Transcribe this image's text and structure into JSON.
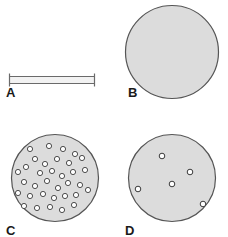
{
  "figure": {
    "type": "scientific-figure",
    "width": 228,
    "height": 237,
    "background_color": "#ffffff"
  },
  "style": {
    "disc_fill": "#dcdcdc",
    "disc_stroke": "#555555",
    "pore_fill": "#ffffff",
    "pore_stroke": "#3a3a3a",
    "bar_fill": "#f2f2f2",
    "bar_stroke": "#6a6a6a",
    "label_color": "#1a1a1a"
  },
  "panels": [
    {
      "id": "A",
      "label": "A",
      "name": "panel-a-side-view",
      "shape": "bar",
      "label_x": 6,
      "label_y": 92,
      "bar": {
        "x": 9,
        "y": 76,
        "width": 85,
        "height": 7,
        "end_cap_height": 13
      }
    },
    {
      "id": "B",
      "label": "B",
      "name": "panel-b-plain-disc",
      "shape": "circle",
      "label_x": 128,
      "label_y": 92,
      "circle": {
        "cx": 172,
        "cy": 52,
        "r": 47
      },
      "pores": []
    },
    {
      "id": "C",
      "label": "C",
      "name": "panel-c-dense-pores",
      "shape": "circle",
      "label_x": 6,
      "label_y": 228,
      "circle": {
        "cx": 55,
        "cy": 178,
        "r": 44
      },
      "pore_count": 34,
      "pore_radius": 2.6,
      "pores": [
        {
          "cx": 30,
          "cy": 149
        },
        {
          "cx": 49,
          "cy": 146
        },
        {
          "cx": 63,
          "cy": 149
        },
        {
          "cx": 75,
          "cy": 154
        },
        {
          "cx": 35,
          "cy": 159
        },
        {
          "cx": 45,
          "cy": 164
        },
        {
          "cx": 57,
          "cy": 159
        },
        {
          "cx": 69,
          "cy": 163
        },
        {
          "cx": 82,
          "cy": 158
        },
        {
          "cx": 18,
          "cy": 172
        },
        {
          "cx": 26,
          "cy": 167
        },
        {
          "cx": 40,
          "cy": 173
        },
        {
          "cx": 52,
          "cy": 171
        },
        {
          "cx": 62,
          "cy": 176
        },
        {
          "cx": 73,
          "cy": 172
        },
        {
          "cx": 85,
          "cy": 170
        },
        {
          "cx": 24,
          "cy": 182
        },
        {
          "cx": 35,
          "cy": 186
        },
        {
          "cx": 47,
          "cy": 181
        },
        {
          "cx": 58,
          "cy": 188
        },
        {
          "cx": 68,
          "cy": 183
        },
        {
          "cx": 80,
          "cy": 185
        },
        {
          "cx": 18,
          "cy": 193
        },
        {
          "cx": 30,
          "cy": 196
        },
        {
          "cx": 43,
          "cy": 194
        },
        {
          "cx": 54,
          "cy": 198
        },
        {
          "cx": 65,
          "cy": 196
        },
        {
          "cx": 76,
          "cy": 195
        },
        {
          "cx": 88,
          "cy": 190
        },
        {
          "cx": 24,
          "cy": 206
        },
        {
          "cx": 37,
          "cy": 208
        },
        {
          "cx": 50,
          "cy": 207
        },
        {
          "cx": 62,
          "cy": 210
        },
        {
          "cx": 74,
          "cy": 205
        }
      ]
    },
    {
      "id": "D",
      "label": "D",
      "name": "panel-d-sparse-pores",
      "shape": "circle",
      "label_x": 125,
      "label_y": 228,
      "circle": {
        "cx": 172,
        "cy": 178,
        "r": 44
      },
      "pore_count": 5,
      "pore_radius": 2.8,
      "pores": [
        {
          "cx": 162,
          "cy": 156
        },
        {
          "cx": 190,
          "cy": 172
        },
        {
          "cx": 172,
          "cy": 184
        },
        {
          "cx": 138,
          "cy": 189
        },
        {
          "cx": 203,
          "cy": 204
        }
      ]
    }
  ]
}
